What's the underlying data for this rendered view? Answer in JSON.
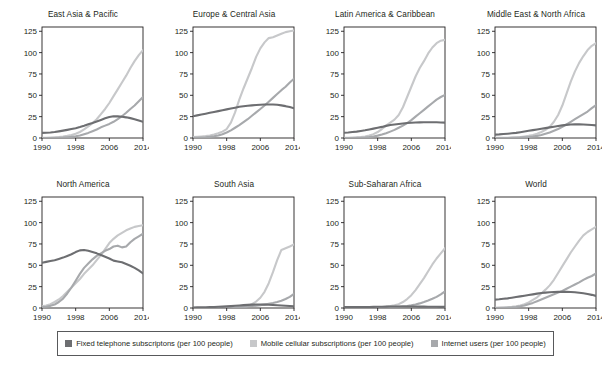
{
  "figure": {
    "width": 605,
    "height": 371,
    "background": "#ffffff",
    "axis_color": "#231f20",
    "tick_label_color": "#231f20"
  },
  "legend": {
    "position": "bottom",
    "border_color": "#58595b",
    "entries": [
      {
        "label": "Fixed telephone subscriptons (per 100 people)",
        "color": "#6d6e71",
        "key": "fixed_telephone"
      },
      {
        "label": "Mobile cellular subscriptions (per 100 people)",
        "color": "#c7c8ca",
        "key": "mobile_cellular"
      },
      {
        "label": "Internet users (per 100 people)",
        "color": "#a7a9ac",
        "key": "internet_users"
      }
    ]
  },
  "chart_data": {
    "type": "line",
    "title": "",
    "subtitle": "",
    "xlabel": "",
    "ylabel": "",
    "xlim": [
      1990,
      2014
    ],
    "ylim": [
      0,
      130
    ],
    "yticks": [
      0,
      25,
      50,
      75,
      100,
      125
    ],
    "xticks": [
      1990,
      1998,
      2006,
      2014
    ],
    "xtick_labels": [
      "1990",
      "1998",
      "2006",
      "2014"
    ],
    "ytick_labels": [
      "0",
      "25",
      "50",
      "75",
      "100",
      "125"
    ],
    "grid": false,
    "legend_position": "bottom",
    "facet_layout": {
      "rows": 2,
      "cols": 4
    },
    "x": [
      1990,
      1991,
      1992,
      1993,
      1994,
      1995,
      1996,
      1997,
      1998,
      1999,
      2000,
      2001,
      2002,
      2003,
      2004,
      2005,
      2006,
      2007,
      2008,
      2009,
      2010,
      2011,
      2012,
      2013,
      2014
    ],
    "panels": [
      {
        "title": "East Asia & Pacific",
        "series": [
          {
            "name": "Fixed telephone subscriptons (per 100 people)",
            "color": "#6d6e71",
            "values": [
              6,
              6.2,
              6.5,
              7,
              7.8,
              8.6,
              9.5,
              10.5,
              11.5,
              12.8,
              14.3,
              16,
              17.6,
              19.4,
              21.2,
              23,
              24.6,
              25.5,
              25.3,
              24.8,
              24.2,
              23.3,
              22,
              20.4,
              18.9
            ]
          },
          {
            "name": "Mobile cellular subscriptions (per 100 people)",
            "color": "#c7c8ca",
            "values": [
              0.2,
              0.3,
              0.4,
              0.6,
              1,
              1.6,
              2.5,
              3.6,
              5,
              7,
              10,
              13.5,
              17.5,
              22,
              28,
              34,
              41,
              49,
              57,
              65,
              73,
              82,
              90,
              97,
              103
            ]
          },
          {
            "name": "Internet users (per 100 people)",
            "color": "#a7a9ac",
            "values": [
              0,
              0.02,
              0.05,
              0.1,
              0.2,
              0.4,
              0.8,
              1.3,
              2,
              3,
              4.5,
              6,
              8,
              10,
              12.5,
              14.5,
              16.5,
              19,
              22,
              25.5,
              29.5,
              34,
              38,
              43,
              48
            ]
          }
        ]
      },
      {
        "title": "Europe & Central Asia",
        "series": [
          {
            "name": "Fixed telephone subscriptons (per 100 people)",
            "color": "#6d6e71",
            "values": [
              25.5,
              26.5,
              27.5,
              28.5,
              29.5,
              30.5,
              31.5,
              32.5,
              33.5,
              34.5,
              35.5,
              36.5,
              37.2,
              37.8,
              38.2,
              38.6,
              39,
              39.2,
              39.3,
              39.2,
              38.9,
              38.2,
              37.3,
              36.2,
              34.8
            ]
          },
          {
            "name": "Mobile cellular subscriptions (per 100 people)",
            "color": "#c7c8ca",
            "values": [
              1,
              1.3,
              1.7,
              2.2,
              3,
              4,
              5.5,
              7.5,
              10.5,
              18,
              30,
              45,
              58,
              70,
              82,
              95,
              105,
              112,
              117,
              118,
              120,
              122,
              124,
              125,
              126
            ]
          },
          {
            "name": "Internet users (per 100 people)",
            "color": "#a7a9ac",
            "values": [
              0.2,
              0.3,
              0.5,
              0.8,
              1.3,
              2,
              3,
              4.5,
              6.5,
              9,
              12,
              15,
              18.5,
              22,
              26,
              30,
              34,
              38,
              42.5,
              47,
              51.5,
              56,
              60,
              65,
              69.5
            ]
          }
        ]
      },
      {
        "title": "Latin America & Caribbean",
        "series": [
          {
            "name": "Fixed telephone subscriptons (per 100 people)",
            "color": "#6d6e71",
            "values": [
              6.2,
              6.5,
              7,
              7.5,
              8.2,
              9,
              10,
              11,
              12,
              13,
              14.2,
              15.2,
              15.8,
              16.4,
              17,
              17.5,
              17.9,
              18.1,
              18.3,
              18.4,
              18.5,
              18.5,
              18.4,
              18.2,
              18
            ]
          },
          {
            "name": "Mobile cellular subscriptions (per 100 people)",
            "color": "#c7c8ca",
            "values": [
              0.1,
              0.2,
              0.4,
              0.7,
              1.2,
              1.8,
              2.8,
              4.5,
              7,
              10.5,
              14.5,
              18,
              21.5,
              27,
              36,
              48,
              60,
              72,
              82,
              90,
              99,
              106,
              111,
              114,
              115
            ]
          },
          {
            "name": "Internet users (per 100 people)",
            "color": "#a7a9ac",
            "values": [
              0,
              0.02,
              0.05,
              0.1,
              0.2,
              0.5,
              1,
              1.8,
              2.8,
              4,
              5.5,
              7.5,
              9.5,
              12,
              14.5,
              17.5,
              21,
              25,
              29,
              33,
              37,
              41,
              45,
              48,
              50.5
            ]
          }
        ]
      },
      {
        "title": "Middle East & North Africa",
        "series": [
          {
            "name": "Fixed telephone subscriptons (per 100 people)",
            "color": "#6d6e71",
            "values": [
              4,
              4.2,
              4.6,
              5,
              5.5,
              6,
              6.8,
              7.6,
              8.4,
              9.2,
              10,
              10.8,
              11.6,
              12.4,
              13.2,
              14,
              14.8,
              15.4,
              15.8,
              16,
              16,
              15.8,
              15.5,
              15.2,
              14.8
            ]
          },
          {
            "name": "Mobile cellular subscriptions (per 100 people)",
            "color": "#c7c8ca",
            "values": [
              0.1,
              0.1,
              0.2,
              0.3,
              0.5,
              0.8,
              1.2,
              1.8,
              2.5,
              3.5,
              5,
              7,
              9.5,
              13,
              19,
              27,
              38,
              52,
              66,
              78,
              88,
              96,
              103,
              108,
              111
            ]
          },
          {
            "name": "Internet users (per 100 people)",
            "color": "#a7a9ac",
            "values": [
              0,
              0.01,
              0.02,
              0.05,
              0.1,
              0.2,
              0.4,
              0.7,
              1.1,
              1.7,
              2.5,
              3.5,
              5,
              6.5,
              8.5,
              10.5,
              13,
              16,
              19,
              22,
              25,
              28,
              31,
              35,
              38.5
            ]
          }
        ]
      },
      {
        "title": "North America",
        "series": [
          {
            "name": "Fixed telephone subscriptons (per 100 people)",
            "color": "#6d6e71",
            "values": [
              53,
              54,
              55,
              56,
              57.5,
              59,
              61,
              63,
              65.5,
              67.5,
              68,
              67,
              65.5,
              64,
              62,
              60,
              58,
              55.5,
              54.5,
              53.5,
              51.5,
              49.5,
              47,
              44,
              40.5
            ]
          },
          {
            "name": "Mobile cellular subscriptions (per 100 people)",
            "color": "#c7c8ca",
            "values": [
              2,
              3,
              4.5,
              7,
              10,
              14,
              19,
              24,
              29,
              34,
              40,
              45,
              50,
              56,
              62,
              69,
              76,
              81,
              85,
              88,
              91,
              93,
              95,
              96,
              97
            ]
          },
          {
            "name": "Internet users (per 100 people)",
            "color": "#a7a9ac",
            "values": [
              1,
              1.5,
              2.5,
              4,
              7,
              11,
              17,
              24,
              32,
              40,
              47,
              52,
              57,
              61,
              64,
              67,
              69,
              72,
              73,
              71,
              72,
              77,
              81,
              84,
              87
            ]
          }
        ]
      },
      {
        "title": "South Asia",
        "series": [
          {
            "name": "Fixed telephone subscriptons (per 100 people)",
            "color": "#6d6e71",
            "values": [
              0.6,
              0.7,
              0.8,
              0.9,
              1.1,
              1.2,
              1.4,
              1.6,
              1.9,
              2.2,
              2.6,
              3,
              3.4,
              3.7,
              4,
              4.1,
              4.1,
              4,
              3.8,
              3.5,
              3.2,
              2.9,
              2.6,
              2.3,
              2
            ]
          },
          {
            "name": "Mobile cellular subscriptions (per 100 people)",
            "color": "#c7c8ca",
            "values": [
              0,
              0,
              0.01,
              0.02,
              0.04,
              0.07,
              0.1,
              0.2,
              0.3,
              0.4,
              0.6,
              1,
              1.5,
              2.5,
              4.5,
              7.5,
              12,
              19,
              29,
              42,
              56,
              68,
              70,
              72,
              74.5
            ]
          },
          {
            "name": "Internet users (per 100 people)",
            "color": "#a7a9ac",
            "values": [
              0,
              0,
              0.01,
              0.02,
              0.03,
              0.05,
              0.08,
              0.15,
              0.25,
              0.4,
              0.6,
              0.9,
              1.3,
              1.8,
              2.3,
              2.8,
              3.4,
              4.1,
              4.9,
              5.8,
              7,
              8.5,
              10.5,
              13,
              16.5
            ]
          }
        ]
      },
      {
        "title": "Sub-Saharan Africa",
        "series": [
          {
            "name": "Fixed telephone subscriptons (per 100 people)",
            "color": "#6d6e71",
            "values": [
              1,
              1,
              1.05,
              1.1,
              1.15,
              1.2,
              1.25,
              1.3,
              1.4,
              1.5,
              1.6,
              1.7,
              1.75,
              1.8,
              1.8,
              1.8,
              1.75,
              1.7,
              1.65,
              1.6,
              1.5,
              1.45,
              1.4,
              1.35,
              1.3
            ]
          },
          {
            "name": "Mobile cellular subscriptions (per 100 people)",
            "color": "#c7c8ca",
            "values": [
              0,
              0,
              0.02,
              0.04,
              0.07,
              0.1,
              0.2,
              0.3,
              0.5,
              0.8,
              1.4,
              2.2,
              3.2,
              4.5,
              7,
              10.5,
              15,
              21,
              28,
              35,
              43,
              51,
              58,
              64,
              70
            ]
          },
          {
            "name": "Internet users (per 100 people)",
            "color": "#a7a9ac",
            "values": [
              0,
              0,
              0.01,
              0.02,
              0.03,
              0.05,
              0.1,
              0.15,
              0.25,
              0.35,
              0.5,
              0.7,
              1,
              1.4,
              1.9,
              2.4,
              3.2,
              4.2,
              5.4,
              7,
              8.8,
              10.8,
              13,
              16,
              19.5
            ]
          }
        ]
      },
      {
        "title": "World",
        "series": [
          {
            "name": "Fixed telephone subscriptons (per 100 people)",
            "color": "#6d6e71",
            "values": [
              9.8,
              10.2,
              10.8,
              11.3,
              12,
              12.8,
              13.6,
              14.4,
              15.2,
              16,
              16.8,
              17.5,
              18,
              18.4,
              18.7,
              18.9,
              19,
              18.9,
              18.7,
              18.4,
              17.8,
              17.2,
              16.4,
              15.4,
              14.2
            ]
          },
          {
            "name": "Mobile cellular subscriptions (per 100 people)",
            "color": "#c7c8ca",
            "values": [
              0.2,
              0.3,
              0.5,
              0.8,
              1.3,
              2,
              3,
              4.5,
              6.5,
              9.5,
              12.5,
              17,
              21.5,
              26.5,
              33,
              41,
              49,
              57,
              65,
              72,
              79,
              85,
              89,
              92,
              95
            ]
          },
          {
            "name": "Internet users (per 100 people)",
            "color": "#a7a9ac",
            "values": [
              0.05,
              0.1,
              0.2,
              0.4,
              0.7,
              1.2,
              2,
              3,
              4.5,
              6,
              8,
              10,
              12,
              14,
              16,
              18,
              20,
              22.5,
              25,
              27.5,
              30,
              33,
              35.5,
              37.5,
              40.5
            ]
          }
        ]
      }
    ]
  }
}
